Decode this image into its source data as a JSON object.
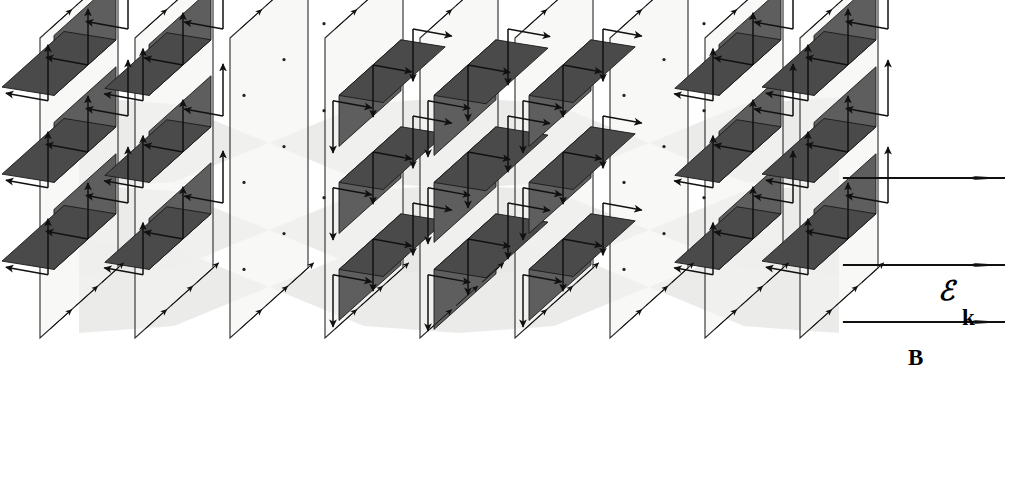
{
  "figure": {
    "background_color": "#ffffff"
  },
  "labels": [
    {
      "id": "E",
      "text": "ℰ",
      "name": "electric-field-label",
      "x": 938,
      "y": 300,
      "style": "lbl-E"
    },
    {
      "id": "k",
      "text": "k",
      "name": "wave-vector-label",
      "x": 962,
      "y": 325,
      "style": "lbl-k"
    },
    {
      "id": "B",
      "text": "B",
      "name": "magnetic-field-label",
      "x": 908,
      "y": 365,
      "style": "lbl-B"
    }
  ],
  "colors": {
    "plane_fill": "#f4f4f2",
    "plane_stroke": "#2b2b2b",
    "shade_fill": "#5e5e5e",
    "shade_fill_dark": "#4a4a4a",
    "shade_stroke": "#1a1a1a",
    "arrow": "#111111",
    "envelope": "#e8e8e6",
    "label": "#000000"
  },
  "geometry": {
    "plane_count": 9,
    "plane_spacing_px": 95,
    "first_plane_x": 40,
    "plane_width_px": 78,
    "plane_height_px": 300,
    "plane_top_y": 38,
    "shear_dx": 78,
    "shear_dy": -70,
    "lattice_rows": 3,
    "lattice_cols": 3,
    "row_spacing_px": 87,
    "col_spacing_px": 40
  },
  "chart_data": {
    "type": "line",
    "xlabel": "propagation distance along k",
    "ylabel": "field amplitude",
    "x": [
      0,
      1,
      2,
      3,
      4,
      5,
      6,
      7,
      8
    ],
    "series": [
      {
        "name": "ℰ (electric field)",
        "direction": "vertical (y)",
        "values": [
          1.0,
          0.85,
          0.0,
          -0.85,
          -1.0,
          -0.85,
          0.0,
          0.85,
          1.0
        ]
      },
      {
        "name": "B (magnetic field)",
        "direction": "horizontal (z)",
        "values": [
          1.0,
          0.85,
          0.0,
          -0.85,
          -1.0,
          -0.85,
          0.0,
          0.85,
          1.0
        ]
      }
    ],
    "legend": [
      "ℰ",
      "B",
      "k"
    ]
  },
  "planes": [
    {
      "index": 0,
      "x": 40,
      "E_dir": "up",
      "B_dir": "left",
      "amplitude": 1.0
    },
    {
      "index": 1,
      "x": 135,
      "E_dir": "up",
      "B_dir": "left",
      "amplitude": 0.85
    },
    {
      "index": 2,
      "x": 230,
      "E_dir": "none",
      "B_dir": "none",
      "amplitude": 0.0
    },
    {
      "index": 3,
      "x": 325,
      "E_dir": "down",
      "B_dir": "right",
      "amplitude": 0.85
    },
    {
      "index": 4,
      "x": 420,
      "E_dir": "down",
      "B_dir": "right",
      "amplitude": 1.0
    },
    {
      "index": 5,
      "x": 515,
      "E_dir": "down",
      "B_dir": "right",
      "amplitude": 0.85
    },
    {
      "index": 6,
      "x": 610,
      "E_dir": "none",
      "B_dir": "none",
      "amplitude": 0.0
    },
    {
      "index": 7,
      "x": 705,
      "E_dir": "up",
      "B_dir": "left",
      "amplitude": 0.85
    },
    {
      "index": 8,
      "x": 800,
      "E_dir": "up",
      "B_dir": "left",
      "amplitude": 1.0
    }
  ],
  "k_arrows": [
    {
      "row": 0,
      "y": 178
    },
    {
      "row": 1,
      "y": 265
    },
    {
      "row": 2,
      "y": 322
    }
  ]
}
